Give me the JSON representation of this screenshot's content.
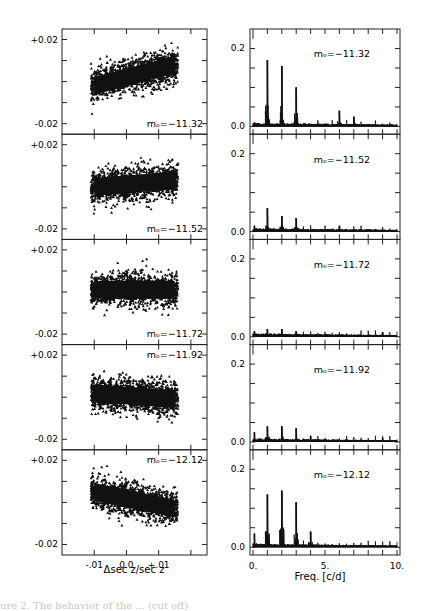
{
  "figure": {
    "caption_fragment": "ure 2.  The behavior of the  ... (cut off)"
  },
  "chart_data": [
    {
      "type": "scatter",
      "title": "",
      "xlabel": "Δsec z/sec z",
      "ylabel": "",
      "xlim": [
        -0.02,
        0.025
      ],
      "ylim": [
        -0.025,
        0.025
      ],
      "x_ticks": [
        "-.01",
        "0.0",
        "+.01"
      ],
      "y_ticks": [
        "+0.02",
        "-0.02"
      ],
      "grid": false,
      "marker": "triangle",
      "panels": [
        {
          "label": "mₒ=−11.32",
          "cloud": {
            "xmin": -0.011,
            "xmax": 0.016,
            "ycenter_left": -0.002,
            "ycenter_right": 0.008,
            "spread": 0.007
          }
        },
        {
          "label": "mₒ=−11.52",
          "cloud": {
            "xmin": -0.011,
            "xmax": 0.016,
            "ycenter_left": 0.0,
            "ycenter_right": 0.003,
            "spread": 0.007
          }
        },
        {
          "label": "mₒ=−11.72",
          "cloud": {
            "xmin": -0.011,
            "xmax": 0.016,
            "ycenter_left": 0.001,
            "ycenter_right": 0.001,
            "spread": 0.007
          }
        },
        {
          "label": "mₒ=−11.92",
          "cloud": {
            "xmin": -0.011,
            "xmax": 0.016,
            "ycenter_left": 0.002,
            "ycenter_right": -0.001,
            "spread": 0.007
          }
        },
        {
          "label": "mₒ=−12.12",
          "cloud": {
            "xmin": -0.011,
            "xmax": 0.016,
            "ycenter_left": 0.005,
            "ycenter_right": -0.003,
            "spread": 0.007
          }
        }
      ]
    },
    {
      "type": "line",
      "title": "",
      "xlabel": "Freq. [c/d]",
      "ylabel": "",
      "xlim": [
        0,
        10
      ],
      "ylim": [
        -0.02,
        0.25
      ],
      "x_ticks": [
        "0.",
        "5.",
        "10."
      ],
      "y_ticks": [
        "0.2",
        "0.0"
      ],
      "grid": false,
      "panels": [
        {
          "label": "mₒ=−11.32",
          "peaks": [
            {
              "f": 0.1,
              "a": 0.01
            },
            {
              "f": 1.0,
              "a": 0.17
            },
            {
              "f": 2.0,
              "a": 0.155
            },
            {
              "f": 3.0,
              "a": 0.1
            },
            {
              "f": 6.0,
              "a": 0.04
            },
            {
              "f": 7.0,
              "a": 0.025
            }
          ]
        },
        {
          "label": "mₒ=−11.52",
          "peaks": [
            {
              "f": 0.1,
              "a": 0.015
            },
            {
              "f": 1.0,
              "a": 0.06
            },
            {
              "f": 2.0,
              "a": 0.04
            },
            {
              "f": 3.0,
              "a": 0.035
            },
            {
              "f": 6.0,
              "a": 0.015
            }
          ]
        },
        {
          "label": "mₒ=−11.72",
          "peaks": [
            {
              "f": 0.1,
              "a": 0.015
            },
            {
              "f": 1.0,
              "a": 0.02
            },
            {
              "f": 2.0,
              "a": 0.02
            },
            {
              "f": 3.0,
              "a": 0.015
            },
            {
              "f": 9.0,
              "a": 0.012
            }
          ]
        },
        {
          "label": "mₒ=−11.92",
          "peaks": [
            {
              "f": 0.1,
              "a": 0.025
            },
            {
              "f": 1.0,
              "a": 0.04
            },
            {
              "f": 2.0,
              "a": 0.04
            },
            {
              "f": 3.0,
              "a": 0.035
            },
            {
              "f": 4.0,
              "a": 0.015
            },
            {
              "f": 9.0,
              "a": 0.01
            }
          ]
        },
        {
          "label": "mₒ=−12.12",
          "peaks": [
            {
              "f": 0.1,
              "a": 0.035
            },
            {
              "f": 1.0,
              "a": 0.135
            },
            {
              "f": 2.0,
              "a": 0.145
            },
            {
              "f": 3.0,
              "a": 0.115
            },
            {
              "f": 4.0,
              "a": 0.04
            }
          ]
        }
      ]
    }
  ]
}
